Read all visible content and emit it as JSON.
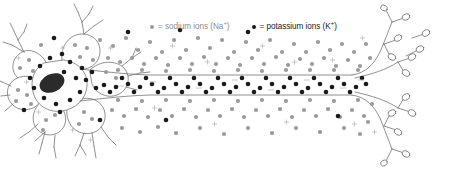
{
  "figure": {
    "background_color": "#ffffff",
    "width": 457,
    "height": 171
  },
  "legend": {
    "position": "top",
    "entries": [
      {
        "marker": "sodium-ion-dot",
        "marker_color": "#9a9a9a",
        "equals": "=",
        "label": "= sodium ions (Na",
        "charge": "+",
        "label_end": ")",
        "full_text": "= sodium ions (Na+)",
        "text_color": "#8c8c8c"
      },
      {
        "marker": "potassium-ion-dot",
        "marker_color": "#1a1a1a",
        "equals": "=",
        "label": "= potassium ions (K",
        "charge": "+",
        "label_end": ")",
        "full_text": "= potassium ions (K+)",
        "text_color": "#1a1a1a"
      }
    ]
  },
  "diagram": {
    "cell_type": "multipolar neuron",
    "outline_color": "#6b6b6b",
    "nucleus": {
      "name": "nucleus",
      "color": "#2b2b2b",
      "cx": 52,
      "cy": 83,
      "rx": 13,
      "ry": 9,
      "rotation": -25
    },
    "soma": {
      "name": "cell-body",
      "cx": 58,
      "cy": 85
    },
    "axon": {
      "name": "axon",
      "top_y": 75,
      "bottom_y": 95,
      "start_x": 75,
      "end_x": 370
    },
    "ions": {
      "sodium": {
        "color": "#9a9a9a",
        "location": "extracellular",
        "radius": 2.1
      },
      "potassium": {
        "color": "#1a1a1a",
        "location": "intracellular-axon",
        "radius": 2.3
      }
    },
    "charge_marks": {
      "outside_symbol": "+",
      "inside_symbol": "−",
      "outside_color": "#b5b5b5",
      "inside_color": "#b0b0b0"
    }
  }
}
